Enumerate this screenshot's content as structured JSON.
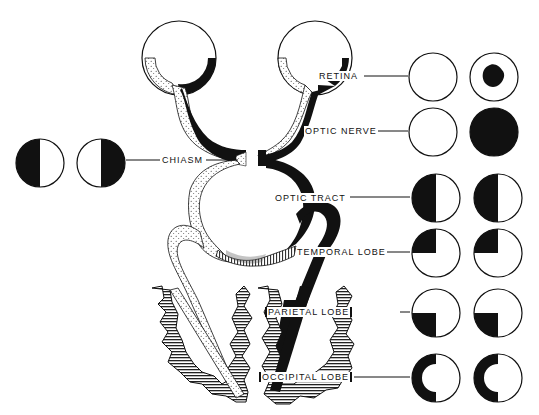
{
  "diagram": {
    "labels": {
      "retina": "RETINA",
      "optic_nerve": "OPTIC NERVE",
      "chiasm": "CHIASM",
      "optic_tract": "OPTIC TRACT",
      "temporal_lobe": "TEMPORAL LOBE",
      "parietal_lobe": "PARIETAL LOBE",
      "occipital_lobe": "OCCIPITAL LOBE"
    },
    "field_defects": [
      {
        "level": "retina",
        "left_eye": "normal",
        "right_eye": "central scotoma (irregular blot)"
      },
      {
        "level": "optic_nerve",
        "left_eye": "normal",
        "right_eye": "complete blindness"
      },
      {
        "level": "chiasm",
        "left_eye": "temporal (left) half lost",
        "right_eye": "temporal (right) half lost"
      },
      {
        "level": "optic_tract",
        "left_eye": "left half lost",
        "right_eye": "left half lost"
      },
      {
        "level": "temporal_lobe",
        "left_eye": "upper-left quadrant lost",
        "right_eye": "upper-left quadrant lost"
      },
      {
        "level": "parietal_lobe",
        "left_eye": "lower-left quadrant lost",
        "right_eye": "lower-left quadrant lost"
      },
      {
        "level": "occipital_lobe",
        "left_eye": "left half lost with macular sparing",
        "right_eye": "left half lost with macular sparing"
      }
    ],
    "colors": {
      "ink": "#111111",
      "paper": "#ffffff"
    }
  }
}
